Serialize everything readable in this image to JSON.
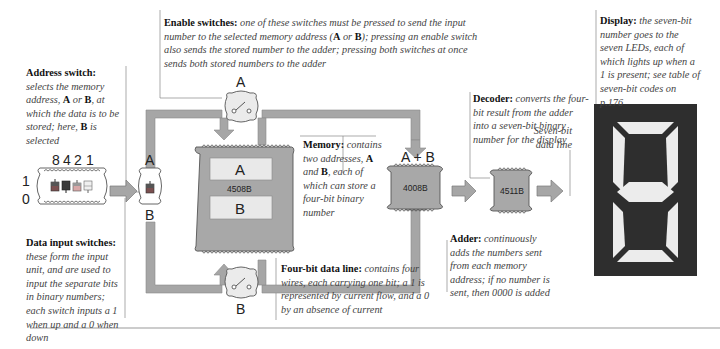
{
  "captions": {
    "address_switch": {
      "title": "Address switch:",
      "body_1": "selects the memory address,",
      "bold_a": "A",
      "body_2": "or",
      "bold_b": "B",
      "body_3": ", at which the data is to be stored; here,",
      "bold_b2": "B",
      "body_4": "is selected"
    },
    "enable_switches": {
      "title": "Enable switches:",
      "body_1": "one of these switches must be pressed to send the input number to the selected memory address (",
      "bold_a": "A",
      "or": "or",
      "bold_b": "B",
      "body_2": "); pressing an enable switch also sends the stored number to the adder; pressing both switches at once sends both stored numbers to the adder"
    },
    "memory": {
      "title": "Memory:",
      "body_1": "contains two addresses,",
      "bold_a": "A",
      "and": "and",
      "bold_b": "B",
      "body_2": ", each of which can store a four-bit binary number"
    },
    "decoder": {
      "title": "Decoder:",
      "body": "converts the four-bit result from the adder into a seven-bit binary number for the display"
    },
    "display": {
      "title": "Display:",
      "body": "the seven-bit number goes to the seven LEDs, each of which lights up when a 1 is present; see table of seven-bit codes on p.176"
    },
    "seven_bit_line": {
      "body": "Seven-bit data line"
    },
    "data_input": {
      "title": "Data input switches:",
      "body": "these form the input unit, and are used to input the separate bits in binary numbers; each switch inputs a 1 when up and a 0 when down"
    },
    "four_bit_line": {
      "title": "Four-bit data line:",
      "body": "contains four wires, each carrying one bit; a 1 is represented by current flow, and a 0 by an absence of current"
    },
    "adder": {
      "title": "Adder:",
      "body": "continuously adds the numbers sent from each memory address; if no number is sent, then 0000 is added"
    }
  },
  "diagram": {
    "input_bits": [
      "8",
      "4",
      "2",
      "1"
    ],
    "input_levels": {
      "high": "1",
      "low": "0"
    },
    "address_labels": {
      "a": "A",
      "b": "B"
    },
    "enable_labels": {
      "a": "A",
      "b": "B"
    },
    "memory_chip": {
      "id": "4508B",
      "slot_a": "A",
      "slot_b": "B"
    },
    "adder_chip": {
      "id": "4008B",
      "label": "A + B"
    },
    "decoder_chip": {
      "id": "4511B"
    }
  },
  "colors": {
    "line_gray": "#a6a6a6",
    "chip_gray": "#a8a8a8",
    "display_dark": "#2e2e2e",
    "segment_light": "#ececec"
  }
}
